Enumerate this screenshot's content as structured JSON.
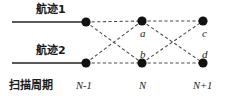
{
  "figure": {
    "title": "",
    "colors": {
      "node": "#111111",
      "solid_line": "#222222",
      "dashed_line": "#4a4a4a",
      "text": "#1a1a1a",
      "background": "#ffffff"
    }
  },
  "tracks": [
    {
      "id": "track-1",
      "label": "航迹1",
      "row": "top"
    },
    {
      "id": "track-2",
      "label": "航迹2",
      "row": "bottom"
    }
  ],
  "axis": {
    "caption": "扫描周期",
    "ticks": [
      {
        "id": "tick-n-minus-1",
        "label": "N-1"
      },
      {
        "id": "tick-n",
        "label": "N"
      },
      {
        "id": "tick-n-plus-1",
        "label": "N+1"
      }
    ]
  },
  "nodes": [
    {
      "id": "node-n1-top",
      "label": "",
      "column": "N-1",
      "row": "top",
      "x": 86,
      "y": 22
    },
    {
      "id": "node-n1-bottom",
      "label": "",
      "column": "N-1",
      "row": "bottom",
      "x": 86,
      "y": 63
    },
    {
      "id": "node-n-top",
      "label": "a",
      "column": "N",
      "row": "top",
      "x": 142,
      "y": 21
    },
    {
      "id": "node-n-bottom",
      "label": "b",
      "column": "N",
      "row": "bottom",
      "x": 142,
      "y": 63
    },
    {
      "id": "node-n2-top",
      "label": "c",
      "column": "N+1",
      "row": "top",
      "x": 203,
      "y": 21
    },
    {
      "id": "node-n2-bottom",
      "label": "d",
      "column": "N+1",
      "row": "bottom",
      "x": 203,
      "y": 63
    }
  ],
  "node_labels": {
    "a": "a",
    "b": "b",
    "c": "c",
    "d": "d"
  },
  "edges": {
    "solid": [
      {
        "id": "lead-in-top",
        "from": "axis-start-top",
        "to": "node-n1-top"
      },
      {
        "id": "lead-in-bottom",
        "from": "axis-start-bottom",
        "to": "node-n1-bottom"
      }
    ],
    "dashed": [
      {
        "id": "edge-n1top-ntop",
        "from": "node-n1-top",
        "to": "node-n-top"
      },
      {
        "id": "edge-n1bottom-nbottom",
        "from": "node-n1-bottom",
        "to": "node-n-bottom"
      },
      {
        "id": "edge-n1top-nbottom",
        "from": "node-n1-top",
        "to": "node-n-bottom"
      },
      {
        "id": "edge-n1bottom-ntop",
        "from": "node-n1-bottom",
        "to": "node-n-top"
      },
      {
        "id": "edge-ntop-n2top",
        "from": "node-n-top",
        "to": "node-n2-top"
      },
      {
        "id": "edge-nbottom-n2bottom",
        "from": "node-n-bottom",
        "to": "node-n2-bottom"
      },
      {
        "id": "edge-ntop-n2bottom",
        "from": "node-n-top",
        "to": "node-n2-bottom"
      },
      {
        "id": "edge-nbottom-n2top",
        "from": "node-n-bottom",
        "to": "node-n2-top"
      }
    ]
  }
}
